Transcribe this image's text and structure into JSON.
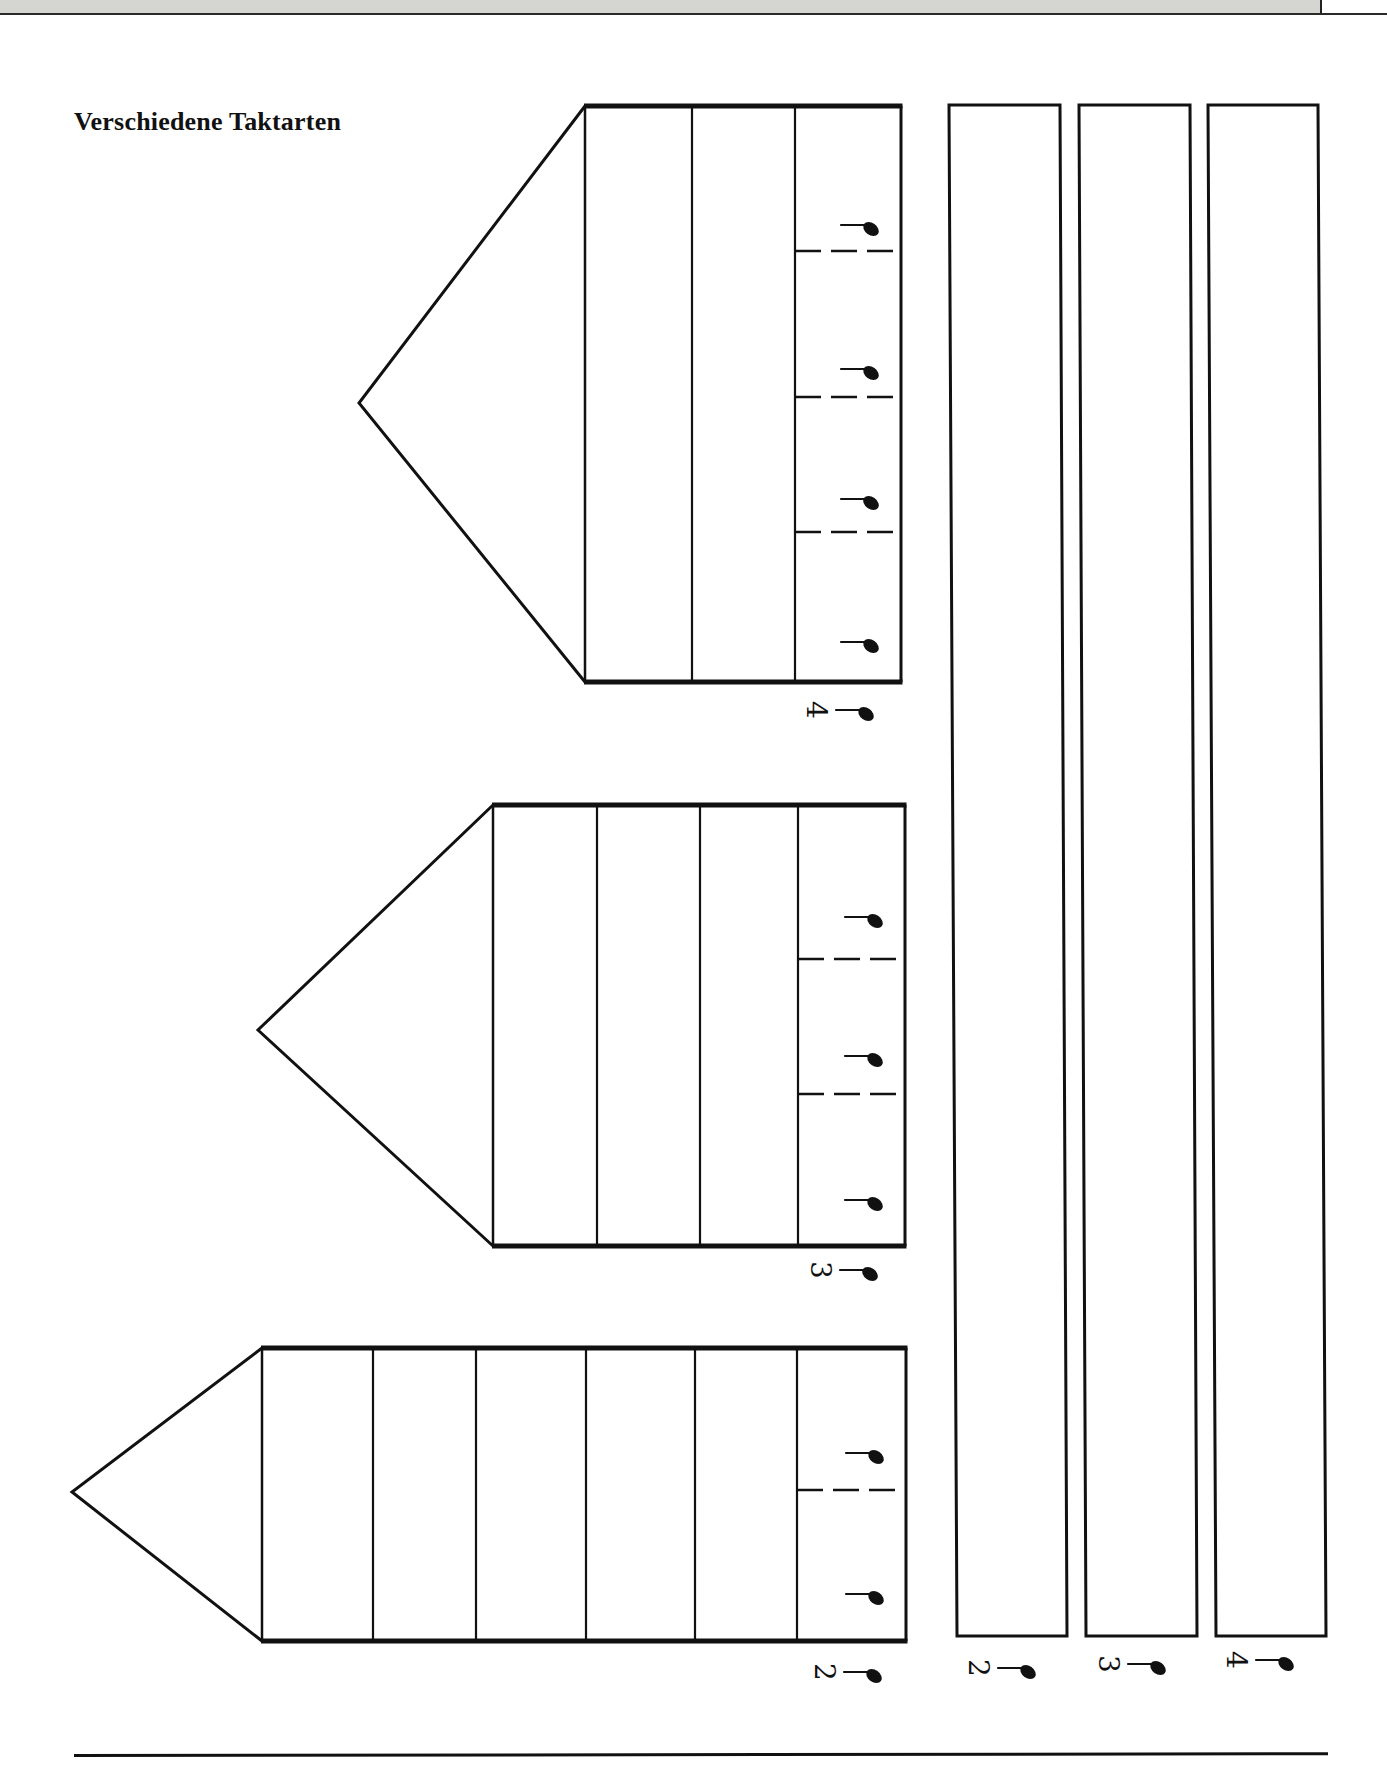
{
  "header": {
    "bar_color": "#d6d6d2"
  },
  "title": "Verschiedene Taktarten",
  "colors": {
    "ink": "#111111",
    "paper": "#ffffff"
  },
  "houses": [
    {
      "id": "house-4-4",
      "time_signature": {
        "numerator": "4",
        "denominator_symbol": "quarter-note-icon"
      },
      "apex": [
        359,
        403
      ],
      "rect": {
        "x": 585,
        "y": 106,
        "w": 316,
        "h": 576
      },
      "column_dividers_x": [
        692,
        795
      ],
      "beat_column": {
        "x": 795,
        "w": 106
      },
      "dashed_lines_y": [
        251,
        397,
        532
      ],
      "note_positions_y": [
        229,
        373,
        503,
        646
      ],
      "label_position": [
        848,
        710
      ]
    },
    {
      "id": "house-3-4",
      "time_signature": {
        "numerator": "3",
        "denominator_symbol": "quarter-note-icon"
      },
      "apex": [
        258,
        1030
      ],
      "rect": {
        "x": 493,
        "y": 805,
        "w": 412,
        "h": 441
      },
      "column_dividers_x": [
        597,
        700,
        798
      ],
      "beat_column": {
        "x": 798,
        "w": 107
      },
      "dashed_lines_y": [
        959,
        1094
      ],
      "note_positions_y": [
        921,
        1060,
        1204
      ],
      "label_position": [
        852,
        1270
      ]
    },
    {
      "id": "house-2-4",
      "time_signature": {
        "numerator": "2",
        "denominator_symbol": "quarter-note-icon"
      },
      "apex": [
        72,
        1492
      ],
      "rect": {
        "x": 262,
        "y": 1348,
        "w": 644,
        "h": 293
      },
      "column_dividers_x": [
        373,
        476,
        586,
        695,
        797
      ],
      "beat_column": {
        "x": 797,
        "w": 109
      },
      "dashed_lines_y": [
        1490
      ],
      "note_positions_y": [
        1457,
        1598
      ],
      "label_position": [
        856,
        1672
      ]
    }
  ],
  "strips": [
    {
      "id": "strip-2-4",
      "time_signature": {
        "numerator": "2",
        "denominator_symbol": "quarter-note-icon"
      },
      "top": {
        "x1": 949,
        "x2": 1060,
        "y": 105
      },
      "bottom": {
        "x1": 957,
        "x2": 1067,
        "y": 1636
      },
      "label_position": [
        1010,
        1668
      ]
    },
    {
      "id": "strip-3-4",
      "time_signature": {
        "numerator": "3",
        "denominator_symbol": "quarter-note-icon"
      },
      "top": {
        "x1": 1079,
        "x2": 1190,
        "y": 105
      },
      "bottom": {
        "x1": 1086,
        "x2": 1197,
        "y": 1636
      },
      "label_position": [
        1140,
        1664
      ]
    },
    {
      "id": "strip-4-4",
      "time_signature": {
        "numerator": "4",
        "denominator_symbol": "quarter-note-icon"
      },
      "top": {
        "x1": 1208,
        "x2": 1318,
        "y": 105
      },
      "bottom": {
        "x1": 1216,
        "x2": 1326,
        "y": 1636
      },
      "label_position": [
        1268,
        1660
      ]
    }
  ]
}
